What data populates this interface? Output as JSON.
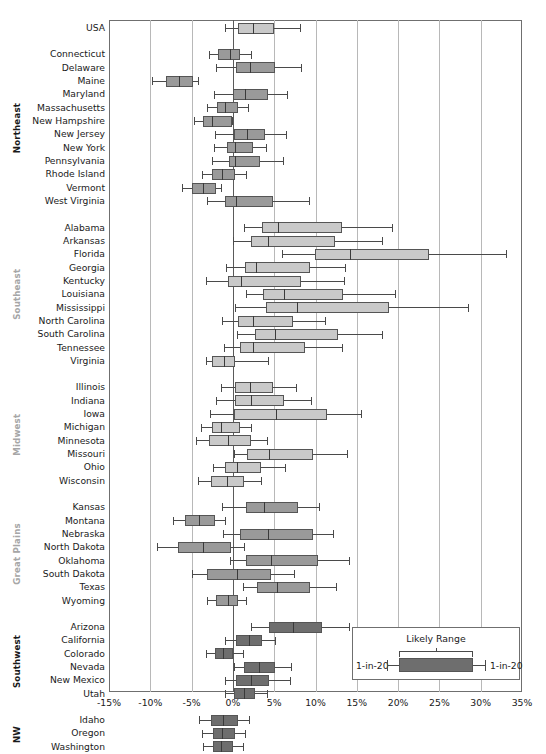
{
  "chart_data": {
    "type": "box",
    "title": "",
    "xlabel": "",
    "ylabel": "",
    "xlim": [
      -15,
      35
    ],
    "xticks": [
      "-15%",
      "-10%",
      "-5%",
      "0%",
      "5%",
      "10%",
      "15%",
      "20%",
      "25%",
      "30%",
      "35%"
    ],
    "xtick_values": [
      -15,
      -10,
      -5,
      0,
      5,
      10,
      15,
      20,
      25,
      30,
      35
    ],
    "grid": "vertical",
    "legend": {
      "title": "Likely Range",
      "left_label": "1-in-20",
      "right_label": "1-in-20"
    },
    "regions": [
      {
        "name": "USA",
        "label_style": "none",
        "shade": "light",
        "rows": [
          {
            "label": "USA",
            "low": -1.0,
            "q1": 0.6,
            "median": 2.4,
            "q3": 5.0,
            "high": 8.1
          }
        ]
      },
      {
        "name": "Northeast",
        "label_style": "dark",
        "shade": "mid",
        "rows": [
          {
            "label": "Connecticut",
            "low": -2.9,
            "q1": -1.8,
            "median": -0.4,
            "q3": 0.8,
            "high": 2.2
          },
          {
            "label": "Delaware",
            "low": -2.0,
            "q1": 0.4,
            "median": 2.1,
            "q3": 5.1,
            "high": 8.2
          },
          {
            "label": "Maine",
            "low": -9.8,
            "q1": -8.1,
            "median": -6.5,
            "q3": -4.8,
            "high": -4.2
          },
          {
            "label": "Maryland",
            "low": -2.3,
            "q1": 0.0,
            "median": 1.5,
            "q3": 4.2,
            "high": 6.6
          },
          {
            "label": "Massachusetts",
            "low": -3.1,
            "q1": -1.9,
            "median": -1.0,
            "q3": 0.6,
            "high": 1.8
          },
          {
            "label": "New Hampshire",
            "low": -4.7,
            "q1": -3.6,
            "median": -2.5,
            "q3": -0.1,
            "high": -0.1
          },
          {
            "label": "New Jersey",
            "low": -2.2,
            "q1": 0.1,
            "median": 1.7,
            "q3": 3.9,
            "high": 6.4
          },
          {
            "label": "New York",
            "low": -2.3,
            "q1": -0.7,
            "median": 0.2,
            "q3": 2.4,
            "high": 4.0
          },
          {
            "label": "Pennsylvania",
            "low": -2.5,
            "q1": -0.5,
            "median": 0.2,
            "q3": 3.3,
            "high": 6.1
          },
          {
            "label": "Rhode Island",
            "low": -3.8,
            "q1": -2.5,
            "median": -1.3,
            "q3": 0.3,
            "high": 1.6
          },
          {
            "label": "Vermont",
            "low": -6.2,
            "q1": -4.9,
            "median": -3.6,
            "q3": -2.1,
            "high": -1.5
          },
          {
            "label": "West Virginia",
            "low": -3.1,
            "q1": -0.9,
            "median": 0.4,
            "q3": 4.8,
            "high": 9.2
          }
        ]
      },
      {
        "name": "Southeast",
        "label_style": "gray",
        "shade": "light",
        "rows": [
          {
            "label": "Alabama",
            "low": 1.3,
            "q1": 3.5,
            "median": 5.5,
            "q3": 13.2,
            "high": 19.3
          },
          {
            "label": "Arkansas",
            "low": 0.0,
            "q1": 2.2,
            "median": 4.2,
            "q3": 12.4,
            "high": 18.0
          },
          {
            "label": "Florida",
            "low": 6.0,
            "q1": 9.9,
            "median": 14.2,
            "q3": 23.8,
            "high": 33.1
          },
          {
            "label": "Georgia",
            "low": -0.8,
            "q1": 1.5,
            "median": 2.8,
            "q3": 9.3,
            "high": 13.6
          },
          {
            "label": "Kentucky",
            "low": -3.3,
            "q1": -0.6,
            "median": 1.0,
            "q3": 8.2,
            "high": 13.5
          },
          {
            "label": "Louisiana",
            "low": 1.6,
            "q1": 3.6,
            "median": 6.2,
            "q3": 13.3,
            "high": 19.6
          },
          {
            "label": "Mississippi",
            "low": 0.2,
            "q1": 4.0,
            "median": 7.7,
            "q3": 18.9,
            "high": 28.5
          },
          {
            "label": "North Carolina",
            "low": -1.3,
            "q1": 0.6,
            "median": 2.4,
            "q3": 7.3,
            "high": 11.2
          },
          {
            "label": "South Carolina",
            "low": 0.5,
            "q1": 2.7,
            "median": 5.1,
            "q3": 12.7,
            "high": 18.1
          },
          {
            "label": "Tennessee",
            "low": -1.1,
            "q1": 0.9,
            "median": 2.4,
            "q3": 8.7,
            "high": 13.2
          },
          {
            "label": "Virginia",
            "low": -3.3,
            "q1": -2.5,
            "median": -1.1,
            "q3": 0.2,
            "high": 4.3
          }
        ]
      },
      {
        "name": "Midwest",
        "label_style": "gray",
        "shade": "light",
        "rows": [
          {
            "label": "Illinois",
            "low": -1.5,
            "q1": 0.2,
            "median": 2.1,
            "q3": 4.9,
            "high": 7.6
          },
          {
            "label": "Indiana",
            "low": -2.1,
            "q1": 0.3,
            "median": 2.2,
            "q3": 6.2,
            "high": 9.5
          },
          {
            "label": "Iowa",
            "low": -2.8,
            "q1": 0.1,
            "median": 5.2,
            "q3": 11.4,
            "high": 15.5
          },
          {
            "label": "Michigan",
            "low": -3.9,
            "q1": -2.5,
            "median": -1.4,
            "q3": 0.8,
            "high": 2.2
          },
          {
            "label": "Minnesota",
            "low": -4.5,
            "q1": -2.9,
            "median": -0.6,
            "q3": 2.2,
            "high": 4.1
          },
          {
            "label": "Missouri",
            "low": 0.1,
            "q1": 1.7,
            "median": 4.4,
            "q3": 9.7,
            "high": 13.8
          },
          {
            "label": "Ohio",
            "low": -2.4,
            "q1": -0.9,
            "median": 0.5,
            "q3": 3.4,
            "high": 6.3
          },
          {
            "label": "Wisconsin",
            "low": -4.2,
            "q1": -2.6,
            "median": -0.7,
            "q3": 1.4,
            "high": 3.4
          }
        ]
      },
      {
        "name": "Great Plains",
        "label_style": "gray",
        "shade": "mid",
        "rows": [
          {
            "label": "Kansas",
            "low": -1.3,
            "q1": 1.6,
            "median": 3.8,
            "q3": 7.9,
            "high": 10.4
          },
          {
            "label": "Montana",
            "low": -7.2,
            "q1": -5.8,
            "median": -4.1,
            "q3": -2.2,
            "high": -1.0
          },
          {
            "label": "Nebraska",
            "low": -1.2,
            "q1": 0.9,
            "median": 4.2,
            "q3": 9.7,
            "high": 12.1
          },
          {
            "label": "North Dakota",
            "low": -9.2,
            "q1": -6.7,
            "median": -3.6,
            "q3": -0.2,
            "high": 1.3
          },
          {
            "label": "Oklahoma",
            "low": -0.3,
            "q1": 1.6,
            "median": 4.6,
            "q3": 10.3,
            "high": 14.0
          },
          {
            "label": "South Dakota",
            "low": -5.0,
            "q1": -3.1,
            "median": 0.5,
            "q3": 4.6,
            "high": 7.4
          },
          {
            "label": "Texas",
            "low": 1.2,
            "q1": 2.9,
            "median": 5.3,
            "q3": 9.3,
            "high": 12.5
          },
          {
            "label": "Wyoming",
            "low": -3.1,
            "q1": -2.0,
            "median": -0.6,
            "q3": 0.6,
            "high": 1.6
          }
        ]
      },
      {
        "name": "Southwest",
        "label_style": "dark",
        "shade": "dark",
        "rows": [
          {
            "label": "Arizona",
            "low": 2.2,
            "q1": 4.4,
            "median": 7.3,
            "q3": 10.8,
            "high": 14.0
          },
          {
            "label": "California",
            "low": -1.0,
            "q1": 0.4,
            "median": 1.9,
            "q3": 3.5,
            "high": 5.1
          },
          {
            "label": "Colorado",
            "low": -3.2,
            "q1": -2.2,
            "median": -1.2,
            "q3": 0.0,
            "high": 1.2
          },
          {
            "label": "Nevada",
            "low": 0.1,
            "q1": 1.4,
            "median": 3.1,
            "q3": 5.1,
            "high": 7.0
          },
          {
            "label": "New Mexico",
            "low": -0.9,
            "q1": 0.4,
            "median": 2.2,
            "q3": 4.4,
            "high": 6.9
          },
          {
            "label": "Utah",
            "low": -0.9,
            "q1": 0.1,
            "median": 1.3,
            "q3": 2.7,
            "high": 4.1
          }
        ]
      },
      {
        "name": "NW",
        "label_style": "dark",
        "shade": "dark",
        "rows": [
          {
            "label": "Idaho",
            "low": -4.1,
            "q1": -2.7,
            "median": -1.2,
            "q3": 0.6,
            "high": 2.0
          },
          {
            "label": "Oregon",
            "low": -3.7,
            "q1": -2.4,
            "median": -1.3,
            "q3": 0.2,
            "high": 1.5
          },
          {
            "label": "Washington",
            "low": -3.6,
            "q1": -2.4,
            "median": -1.5,
            "q3": 0.0,
            "high": 1.2
          }
        ]
      }
    ]
  }
}
